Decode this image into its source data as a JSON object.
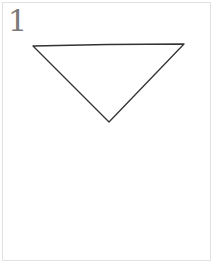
{
  "card": {
    "number_label": "1",
    "shape": {
      "name": "inverted-triangle",
      "points": [
        [
          33,
          46
        ],
        [
          184,
          44
        ],
        [
          109,
          122
        ]
      ],
      "stroke": "#333333"
    },
    "border_color": "#e2e2e2"
  }
}
